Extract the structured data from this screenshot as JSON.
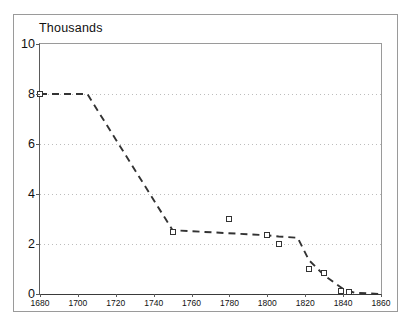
{
  "chart_data": {
    "type": "line",
    "title": "Thousands",
    "subtitle": "",
    "xlabel": "",
    "ylabel": "",
    "xlim": [
      1680,
      1860
    ],
    "ylim": [
      0,
      10
    ],
    "xticks": [
      1680,
      1700,
      1720,
      1740,
      1760,
      1780,
      1800,
      1820,
      1840,
      1860
    ],
    "xtick_labels": [
      "1680",
      "1700",
      "1720",
      "1740",
      "1760",
      "1780",
      "1800",
      "1820",
      "1840",
      "1860"
    ],
    "yticks": [
      0,
      2,
      4,
      6,
      8,
      10
    ],
    "ytick_labels": [
      "0",
      "2",
      "4",
      "6",
      "8",
      "10"
    ],
    "grid": {
      "horizontal": true,
      "vertical": false,
      "style": "dotted",
      "color": "#bdbdbd",
      "at_values": [
        2,
        4,
        6,
        8
      ]
    },
    "legend": {
      "visible": false,
      "position": "none"
    },
    "series": [
      {
        "name": "trend",
        "style": "dashed",
        "color": "#333333",
        "marker": "none",
        "x": [
          1680,
          1705,
          1750,
          1800,
          1806,
          1816,
          1822,
          1830,
          1840,
          1846,
          1860
        ],
        "values": [
          8.0,
          8.0,
          2.55,
          2.35,
          2.3,
          2.25,
          1.35,
          0.75,
          0.2,
          0.05,
          0.0
        ]
      },
      {
        "name": "observations",
        "style": "none",
        "color": "#333333",
        "marker": "open-square",
        "x": [
          1680,
          1750,
          1780,
          1800,
          1806,
          1822,
          1830,
          1839,
          1843
        ],
        "values": [
          8.0,
          2.5,
          3.0,
          2.35,
          2.0,
          1.0,
          0.85,
          0.12,
          0.1
        ]
      }
    ]
  }
}
